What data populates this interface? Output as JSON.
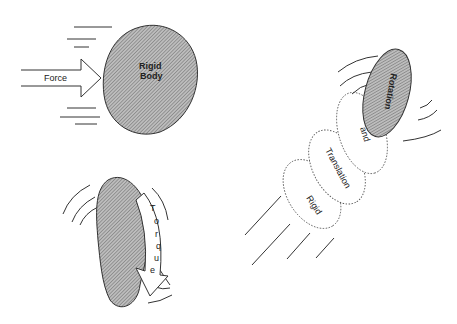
{
  "diagram": {
    "panels": [
      {
        "id": "force",
        "labels": {
          "arrow": "Force",
          "body_line1": "Rigid",
          "body_line2": "Body"
        }
      },
      {
        "id": "torque",
        "labels": {
          "arrow_letters": [
            "T",
            "o",
            "r",
            "q",
            "u",
            "e"
          ]
        }
      },
      {
        "id": "motion",
        "labels": {
          "oval1": "Rigid",
          "oval2": "Translation",
          "oval3": "and",
          "body": "Rotation"
        }
      }
    ],
    "colors": {
      "hatch": "#8a8a8a",
      "outline": "#333333",
      "background": "#ffffff"
    }
  }
}
